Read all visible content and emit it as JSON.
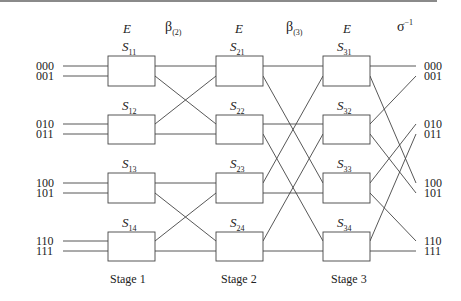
{
  "headers": {
    "e1": "E",
    "beta2": "β",
    "beta2_sub": "(2)",
    "e2": "E",
    "beta3": "β",
    "beta3_sub": "(3)",
    "e3": "E",
    "sigma_inv": "σ",
    "sigma_inv_sup": "−1"
  },
  "inputs": [
    "000",
    "001",
    "010",
    "011",
    "100",
    "101",
    "110",
    "111"
  ],
  "outputs": [
    "000",
    "001",
    "010",
    "011",
    "100",
    "101",
    "110",
    "111"
  ],
  "switches": {
    "stage1": [
      {
        "s": "S",
        "sub": "11"
      },
      {
        "s": "S",
        "sub": "12"
      },
      {
        "s": "S",
        "sub": "13"
      },
      {
        "s": "S",
        "sub": "14"
      }
    ],
    "stage2": [
      {
        "s": "S",
        "sub": "21"
      },
      {
        "s": "S",
        "sub": "22"
      },
      {
        "s": "S",
        "sub": "23"
      },
      {
        "s": "S",
        "sub": "24"
      }
    ],
    "stage3": [
      {
        "s": "S",
        "sub": "31"
      },
      {
        "s": "S",
        "sub": "32"
      },
      {
        "s": "S",
        "sub": "33"
      },
      {
        "s": "S",
        "sub": "34"
      }
    ]
  },
  "stages": [
    "Stage 1",
    "Stage 2",
    "Stage 3"
  ],
  "connections": {
    "stage1_to_stage2": [
      [
        "S11.top",
        "S21.top"
      ],
      [
        "S11.bot",
        "S22.top"
      ],
      [
        "S12.top",
        "S21.bot"
      ],
      [
        "S12.bot",
        "S22.bot"
      ],
      [
        "S13.top",
        "S23.top"
      ],
      [
        "S13.bot",
        "S24.top"
      ],
      [
        "S14.top",
        "S23.bot"
      ],
      [
        "S14.bot",
        "S24.bot"
      ]
    ],
    "stage2_to_stage3": [
      [
        "S21.top",
        "S31.top"
      ],
      [
        "S21.bot",
        "S33.top"
      ],
      [
        "S22.top",
        "S32.top"
      ],
      [
        "S22.bot",
        "S34.top"
      ],
      [
        "S23.top",
        "S31.bot"
      ],
      [
        "S23.bot",
        "S33.bot"
      ],
      [
        "S24.top",
        "S32.bot"
      ],
      [
        "S24.bot",
        "S34.bot"
      ]
    ],
    "stage3_to_output": [
      [
        "S31.top",
        "000"
      ],
      [
        "S31.bot",
        "100"
      ],
      [
        "S32.top",
        "001"
      ],
      [
        "S32.bot",
        "101"
      ],
      [
        "S33.top",
        "010"
      ],
      [
        "S33.bot",
        "110"
      ],
      [
        "S34.top",
        "011"
      ],
      [
        "S34.bot",
        "111"
      ]
    ]
  }
}
